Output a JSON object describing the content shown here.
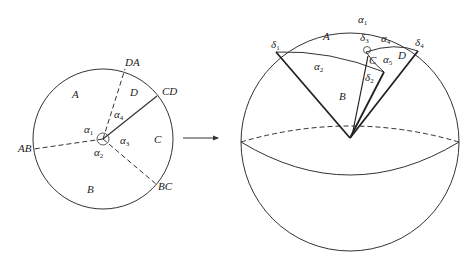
{
  "left_diagram": {
    "regions": [
      "A",
      "B",
      "C",
      "D"
    ],
    "boundaries": [
      "AB",
      "BC",
      "CD",
      "DA"
    ],
    "angles": [
      {
        "sym": "α",
        "sub": "1"
      },
      {
        "sym": "α",
        "sub": "2"
      },
      {
        "sym": "α",
        "sub": "3"
      },
      {
        "sym": "α",
        "sub": "4"
      }
    ]
  },
  "right_diagram": {
    "regions": [
      "A",
      "B",
      "C",
      "D"
    ],
    "arcs": [
      {
        "sym": "α",
        "sub": "1"
      },
      {
        "sym": "α",
        "sub": "2"
      },
      {
        "sym": "α",
        "sub": "4"
      },
      {
        "sym": "α",
        "sub": "5"
      }
    ],
    "deltas": [
      {
        "sym": "δ",
        "sub": "1"
      },
      {
        "sym": "δ",
        "sub": "2"
      },
      {
        "sym": "δ",
        "sub": "3"
      },
      {
        "sym": "δ",
        "sub": "4"
      }
    ]
  },
  "colors": {
    "stroke": "#333333",
    "bold_stroke": "#222222",
    "background": "#ffffff"
  }
}
